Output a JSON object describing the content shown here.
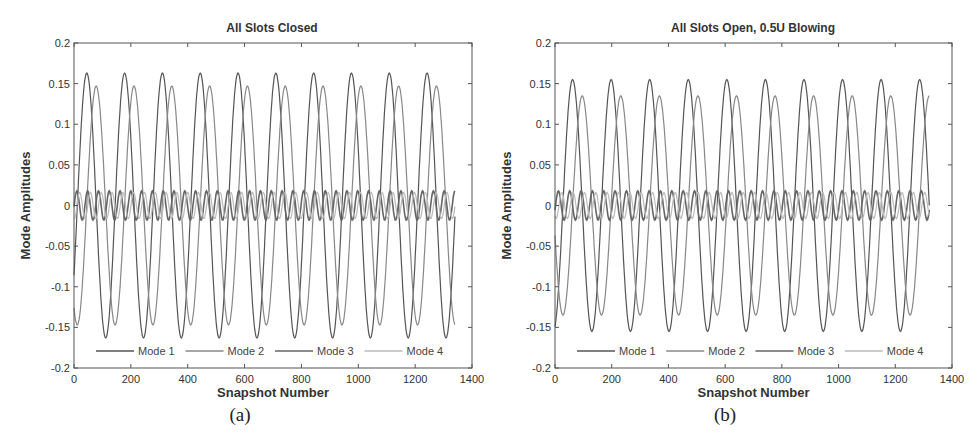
{
  "chart_data": [
    {
      "type": "line",
      "panel_label": "(a)",
      "title": "All Slots Closed",
      "xlabel": "Snapshot Number",
      "ylabel": "Mode Amplitudes",
      "xlim": [
        0,
        1400
      ],
      "ylim": [
        -0.2,
        0.2
      ],
      "xticks": [
        0,
        200,
        400,
        600,
        800,
        1000,
        1200,
        1400
      ],
      "yticks": [
        -0.2,
        -0.15,
        -0.1,
        -0.05,
        0,
        0.05,
        0.1,
        0.15,
        0.2
      ],
      "x_extent": 1340,
      "legend": {
        "position": "bottom-inside",
        "entries": [
          "Mode 1",
          "Mode 2",
          "Mode 3",
          "Mode 4"
        ]
      },
      "series": [
        {
          "name": "Mode 1",
          "color": "#555555",
          "amplitude": 0.163,
          "period": 133,
          "phase_peak": 45
        },
        {
          "name": "Mode 2",
          "color": "#888888",
          "amplitude": 0.147,
          "period": 133,
          "phase_peak": 78
        },
        {
          "name": "Mode 3",
          "color": "#666666",
          "amplitude": 0.018,
          "period": 38,
          "phase_peak": 10
        },
        {
          "name": "Mode 4",
          "color": "#bbbbbb",
          "amplitude": 0.016,
          "period": 38,
          "phase_peak": 20
        }
      ]
    },
    {
      "type": "line",
      "panel_label": "(b)",
      "title": "All Slots Open, 0.5U Blowing",
      "xlabel": "Snapshot Number",
      "ylabel": "Mode Amplitudes",
      "xlim": [
        0,
        1400
      ],
      "ylim": [
        -0.2,
        0.2
      ],
      "xticks": [
        0,
        200,
        400,
        600,
        800,
        1000,
        1200,
        1400
      ],
      "yticks": [
        -0.2,
        -0.15,
        -0.1,
        -0.05,
        0,
        0.05,
        0.1,
        0.15,
        0.2
      ],
      "x_extent": 1320,
      "legend": {
        "position": "bottom-inside",
        "entries": [
          "Mode 1",
          "Mode 2",
          "Mode 3",
          "Mode 4"
        ]
      },
      "series": [
        {
          "name": "Mode 1",
          "color": "#555555",
          "amplitude": 0.155,
          "period": 136,
          "phase_peak": 62
        },
        {
          "name": "Mode 2",
          "color": "#888888",
          "amplitude": 0.135,
          "period": 136,
          "phase_peak": 96
        },
        {
          "name": "Mode 3",
          "color": "#666666",
          "amplitude": 0.018,
          "period": 40,
          "phase_peak": 12
        },
        {
          "name": "Mode 4",
          "color": "#bbbbbb",
          "amplitude": 0.016,
          "period": 40,
          "phase_peak": 24
        }
      ]
    }
  ]
}
